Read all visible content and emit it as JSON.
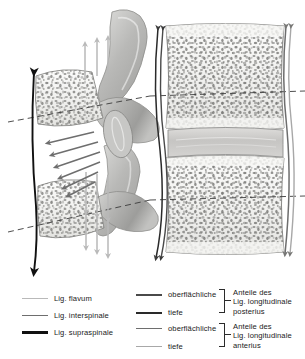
{
  "figure": {
    "colors": {
      "lig_flavum": "#b9b9b9",
      "lig_interspinale": "#6e6e6e",
      "lig_supraspinale": "#111111",
      "post_long_superficial": "#4a4a4a",
      "post_long_deep": "#2a2a2a",
      "ant_long_superficial": "#6e6e6e",
      "ant_long_deep": "#a8a8a8",
      "bone_outline": "#8a8a8a",
      "bone_fill": "#f2f2f0",
      "trabecula": "#7b7b7b",
      "disc_fill": "#c9c9c7",
      "process_fill": "#b6b6b4",
      "dashed_line": "#3a3a3a"
    },
    "reference_lines": [
      {
        "name": "upper-vertebra-midline",
        "y": 108
      },
      {
        "name": "lower-vertebra-midline",
        "y": 202
      }
    ],
    "arrow_groups": [
      {
        "name": "lig-flavum-upper",
        "count": 3,
        "direction": "up",
        "color": "#b9b9b9"
      },
      {
        "name": "lig-flavum-lower",
        "count": 3,
        "direction": "down",
        "color": "#b9b9b9"
      },
      {
        "name": "lig-interspinale",
        "count": 6,
        "direction": "diagonal-down-left",
        "color": "#6e6e6e"
      },
      {
        "name": "lig-supraspinale",
        "count": 1,
        "direction": "vertical-bidirectional",
        "color": "#111111"
      },
      {
        "name": "lig-longitudinale-posterius",
        "count": 2,
        "direction": "vertical-bidirectional",
        "color": "#3a3a3a"
      },
      {
        "name": "lig-longitudinale-anterius",
        "count": 2,
        "direction": "vertical-bidirectional",
        "color": "#6e6e6e"
      }
    ]
  },
  "legend": {
    "left_column": [
      {
        "label": "Lig. flavum",
        "color": "#b9b9b9",
        "thickness": 1.4
      },
      {
        "label": "Lig. interspinale",
        "color": "#6e6e6e",
        "thickness": 1.8
      },
      {
        "label": "Lig. supraspinale",
        "color": "#111111",
        "thickness": 2.4
      }
    ],
    "groups": [
      {
        "items": [
          {
            "label": "oberflächliche",
            "color": "#4a4a4a",
            "thickness": 2.0
          },
          {
            "label": "tiefe",
            "color": "#2a2a2a",
            "thickness": 2.0
          }
        ],
        "group_label_lines": [
          "Anteile des",
          "Lig. longitudinale",
          "posterius"
        ]
      },
      {
        "items": [
          {
            "label": "oberflächliche",
            "color": "#6e6e6e",
            "thickness": 1.8
          },
          {
            "label": "tiefe",
            "color": "#a8a8a8",
            "thickness": 1.6
          }
        ],
        "group_label_lines": [
          "Anteile des",
          "Lig. longitudinale",
          "anterius"
        ]
      }
    ]
  }
}
